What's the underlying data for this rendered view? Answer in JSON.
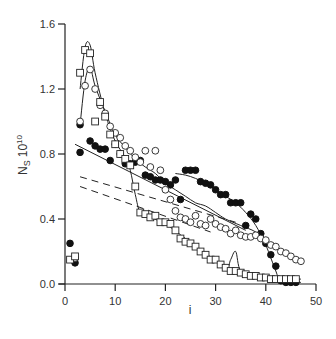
{
  "chart_data": {
    "type": "scatter",
    "title": "",
    "xlabel": "i",
    "ylabel": "N_S 10^10",
    "ylabel_main": "N",
    "ylabel_sub": "S",
    "ylabel_mult": "10",
    "ylabel_exp": "10",
    "xlim": [
      0,
      50
    ],
    "ylim": [
      0,
      1.6
    ],
    "grid": false,
    "legend": "none",
    "x_ticks": [
      0,
      10,
      20,
      30,
      40,
      50
    ],
    "x_tick_labels": [
      "0",
      "10",
      "20",
      "30",
      "40",
      "50"
    ],
    "y_ticks": [
      0.0,
      0.4,
      0.8,
      1.2,
      1.6
    ],
    "y_tick_labels": [
      "0.0",
      "0.4",
      "0.8",
      "1.2",
      "1.6"
    ],
    "series": [
      {
        "name": "filled circles",
        "marker": "filled-circle",
        "points": [
          [
            1,
            0.25
          ],
          [
            2,
            0.13
          ],
          [
            3,
            0.98
          ],
          [
            3,
            0.81
          ],
          [
            5,
            0.88
          ],
          [
            6,
            0.85
          ],
          [
            7,
            0.83
          ],
          [
            8,
            0.83
          ],
          [
            9,
            0.76
          ],
          [
            10,
            0.86
          ],
          [
            11,
            0.8
          ],
          [
            12,
            0.74
          ],
          [
            13,
            0.74
          ],
          [
            14,
            0.75
          ],
          [
            15,
            0.76
          ],
          [
            16,
            0.67
          ],
          [
            17,
            0.66
          ],
          [
            18,
            0.64
          ],
          [
            19,
            0.64
          ],
          [
            20,
            0.63
          ],
          [
            21,
            0.61
          ],
          [
            22,
            0.64
          ],
          [
            23,
            0.52
          ],
          [
            24,
            0.7
          ],
          [
            25,
            0.7
          ],
          [
            26,
            0.7
          ],
          [
            27,
            0.63
          ],
          [
            28,
            0.62
          ],
          [
            29,
            0.61
          ],
          [
            30,
            0.58
          ],
          [
            31,
            0.55
          ],
          [
            32,
            0.55
          ],
          [
            33,
            0.5
          ],
          [
            34,
            0.5
          ],
          [
            35,
            0.5
          ],
          [
            36,
            0.36
          ],
          [
            37,
            0.43
          ],
          [
            38,
            0.4
          ],
          [
            39,
            0.31
          ],
          [
            40,
            0.25
          ],
          [
            41,
            0.18
          ],
          [
            42,
            0.11
          ],
          [
            43,
            0.02
          ],
          [
            44,
            0.01
          ],
          [
            45,
            0.01
          ],
          [
            46,
            0.01
          ]
        ]
      },
      {
        "name": "open circles",
        "marker": "open-circle",
        "points": [
          [
            2,
            0.16
          ],
          [
            3,
            1.0
          ],
          [
            4,
            1.22
          ],
          [
            5,
            1.32
          ],
          [
            6,
            1.2
          ],
          [
            7,
            1.1
          ],
          [
            8,
            1.05
          ],
          [
            9,
            0.97
          ],
          [
            10,
            0.93
          ],
          [
            11,
            0.9
          ],
          [
            12,
            0.85
          ],
          [
            13,
            0.82
          ],
          [
            14,
            0.78
          ],
          [
            15,
            0.75
          ],
          [
            16,
            0.82
          ],
          [
            17,
            0.72
          ],
          [
            18,
            0.82
          ],
          [
            19,
            0.7
          ],
          [
            20,
            0.58
          ],
          [
            21,
            0.52
          ],
          [
            22,
            0.45
          ],
          [
            23,
            0.41
          ],
          [
            24,
            0.4
          ],
          [
            25,
            0.38
          ],
          [
            26,
            0.42
          ],
          [
            27,
            0.37
          ],
          [
            28,
            0.36
          ],
          [
            29,
            0.4
          ],
          [
            30,
            0.37
          ],
          [
            31,
            0.35
          ],
          [
            32,
            0.34
          ],
          [
            33,
            0.31
          ],
          [
            34,
            0.33
          ],
          [
            35,
            0.3
          ],
          [
            36,
            0.29
          ],
          [
            37,
            0.29
          ],
          [
            38,
            0.3
          ],
          [
            39,
            0.28
          ],
          [
            40,
            0.27
          ],
          [
            41,
            0.24
          ],
          [
            42,
            0.23
          ],
          [
            43,
            0.2
          ],
          [
            44,
            0.19
          ],
          [
            45,
            0.17
          ],
          [
            46,
            0.15
          ],
          [
            47,
            0.14
          ]
        ]
      },
      {
        "name": "open squares",
        "marker": "open-square",
        "points": [
          [
            1,
            0.15
          ],
          [
            2,
            0.17
          ],
          [
            3,
            1.3
          ],
          [
            4,
            1.44
          ],
          [
            5,
            1.42
          ],
          [
            6,
            1.0
          ],
          [
            7,
            1.12
          ],
          [
            8,
            1.03
          ],
          [
            9,
            0.92
          ],
          [
            10,
            0.86
          ],
          [
            11,
            0.8
          ],
          [
            12,
            0.77
          ],
          [
            13,
            0.73
          ],
          [
            14,
            0.6
          ],
          [
            15,
            0.44
          ],
          [
            16,
            0.43
          ],
          [
            17,
            0.41
          ],
          [
            18,
            0.42
          ],
          [
            19,
            0.38
          ],
          [
            20,
            0.38
          ],
          [
            21,
            0.37
          ],
          [
            22,
            0.33
          ],
          [
            23,
            0.28
          ],
          [
            24,
            0.26
          ],
          [
            25,
            0.25
          ],
          [
            26,
            0.23
          ],
          [
            27,
            0.2
          ],
          [
            28,
            0.18
          ],
          [
            29,
            0.15
          ],
          [
            30,
            0.15
          ],
          [
            31,
            0.12
          ],
          [
            32,
            0.1
          ],
          [
            33,
            0.08
          ],
          [
            34,
            0.08
          ],
          [
            35,
            0.07
          ],
          [
            36,
            0.06
          ],
          [
            37,
            0.05
          ],
          [
            38,
            0.05
          ],
          [
            39,
            0.04
          ],
          [
            40,
            0.04
          ],
          [
            41,
            0.03
          ],
          [
            42,
            0.03
          ],
          [
            43,
            0.03
          ],
          [
            44,
            0.03
          ],
          [
            45,
            0.03
          ],
          [
            46,
            0.03
          ]
        ]
      }
    ],
    "lines": [
      {
        "name": "solid fit line",
        "style": "solid",
        "from": [
          2,
          0.86
        ],
        "to": [
          36,
          0.33
        ]
      },
      {
        "name": "dashed line upper",
        "style": "dashed",
        "from": [
          3,
          0.66
        ],
        "to": [
          34,
          0.38
        ]
      },
      {
        "name": "dashed line lower",
        "style": "dashed",
        "from": [
          3,
          0.6
        ],
        "to": [
          29,
          0.32
        ]
      }
    ],
    "curves": [
      {
        "name": "squares smooth curve",
        "style": "solid",
        "points": [
          [
            3,
            1.2
          ],
          [
            4,
            1.46
          ],
          [
            5,
            1.47
          ],
          [
            6,
            1.3
          ],
          [
            8,
            1.05
          ],
          [
            10,
            0.88
          ],
          [
            12,
            0.78
          ],
          [
            13,
            0.7
          ],
          [
            14,
            0.55
          ],
          [
            15,
            0.44
          ],
          [
            17,
            0.41
          ],
          [
            20,
            0.37
          ],
          [
            24,
            0.28
          ],
          [
            28,
            0.19
          ],
          [
            32,
            0.1
          ],
          [
            33,
            0.15
          ],
          [
            34,
            0.2
          ],
          [
            35,
            0.08
          ],
          [
            38,
            0.05
          ],
          [
            42,
            0.03
          ],
          [
            47,
            0.03
          ]
        ]
      },
      {
        "name": "open circles smooth curve",
        "style": "solid",
        "points": [
          [
            3,
            0.98
          ],
          [
            4,
            1.25
          ],
          [
            5,
            1.33
          ],
          [
            6,
            1.22
          ],
          [
            8,
            1.06
          ],
          [
            10,
            0.92
          ],
          [
            12,
            0.84
          ],
          [
            14,
            0.77
          ],
          [
            16,
            0.72
          ],
          [
            18,
            0.68
          ],
          [
            20,
            0.62
          ],
          [
            22,
            0.58
          ],
          [
            24,
            0.54
          ],
          [
            26,
            0.5
          ],
          [
            28,
            0.48
          ],
          [
            30,
            0.44
          ],
          [
            32,
            0.4
          ],
          [
            35,
            0.36
          ],
          [
            38,
            0.32
          ],
          [
            41,
            0.25
          ],
          [
            43,
            0.21
          ],
          [
            47,
            0.14
          ]
        ]
      },
      {
        "name": "filled circles smooth curve",
        "style": "solid",
        "points": [
          [
            22,
            0.68
          ],
          [
            24,
            0.67
          ],
          [
            26,
            0.65
          ],
          [
            28,
            0.62
          ],
          [
            30,
            0.58
          ],
          [
            32,
            0.54
          ],
          [
            34,
            0.5
          ],
          [
            36,
            0.44
          ],
          [
            38,
            0.36
          ],
          [
            40,
            0.24
          ],
          [
            42,
            0.08
          ],
          [
            43,
            0.02
          ],
          [
            47,
            0.01
          ]
        ]
      }
    ]
  }
}
